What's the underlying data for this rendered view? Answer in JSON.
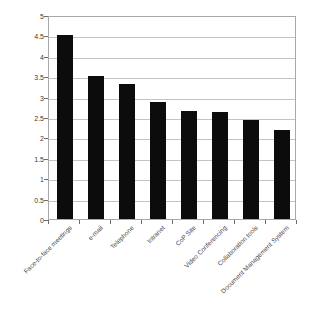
{
  "chart_data": {
    "type": "bar",
    "title": "",
    "xlabel": "",
    "ylabel": "",
    "ylim": [
      0,
      5
    ],
    "ytick_step": 0.5,
    "grid": true,
    "legend": "none",
    "bar_color": "#0c0c0c",
    "categories": [
      "Face-to-face meetings",
      "e-mail",
      "Telephone",
      "Intranet",
      "CoP Site",
      "Video Conferencing",
      "Collaboration tools",
      "Document Management System"
    ],
    "values": [
      4.52,
      3.51,
      3.31,
      2.87,
      2.65,
      2.63,
      2.42,
      2.17
    ],
    "yticks": [
      "0",
      "0.5",
      "1",
      "1.5",
      "2",
      "2.5",
      "3",
      "3.5",
      "4",
      "4.5",
      "5"
    ]
  }
}
